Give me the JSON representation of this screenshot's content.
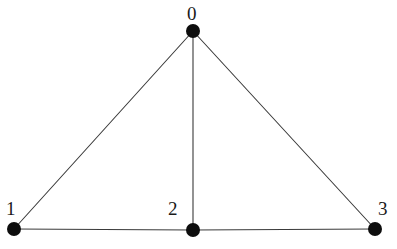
{
  "figure": {
    "type": "graph-diagram",
    "width": 397,
    "height": 249,
    "background_color": "#ffffff"
  },
  "style": {
    "node_color": "#0d0d0d",
    "node_radius": 7,
    "edge_color": "#3a3a3a",
    "edge_width": 1.1,
    "label_color": "#1a1a1a",
    "label_font_size": 19
  },
  "graph": {
    "node_count": 4,
    "edge_count": 5,
    "directed": false,
    "nodes": [
      {
        "id": "0",
        "label": "0",
        "x": 193,
        "y": 31,
        "label_x": 187,
        "label_y": 4
      },
      {
        "id": "1",
        "label": "1",
        "x": 14,
        "y": 229,
        "label_x": 6,
        "label_y": 199
      },
      {
        "id": "2",
        "label": "2",
        "x": 193,
        "y": 230,
        "label_x": 168,
        "label_y": 199
      },
      {
        "id": "3",
        "label": "3",
        "x": 375,
        "y": 229,
        "label_x": 378,
        "label_y": 199
      }
    ],
    "edges": [
      {
        "id": "edge-0-1",
        "source": "0",
        "target": "1",
        "x1": 193,
        "y1": 31,
        "x2": 14,
        "y2": 229
      },
      {
        "id": "edge-0-2",
        "source": "0",
        "target": "2",
        "x1": 193,
        "y1": 31,
        "x2": 193,
        "y2": 230
      },
      {
        "id": "edge-0-3",
        "source": "0",
        "target": "3",
        "x1": 193,
        "y1": 31,
        "x2": 375,
        "y2": 229
      },
      {
        "id": "edge-1-2",
        "source": "1",
        "target": "2",
        "x1": 14,
        "y1": 229,
        "x2": 193,
        "y2": 230
      },
      {
        "id": "edge-2-3",
        "source": "2",
        "target": "3",
        "x1": 193,
        "y1": 230,
        "x2": 375,
        "y2": 229
      }
    ]
  }
}
